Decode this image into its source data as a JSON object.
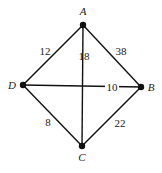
{
  "diagram": {
    "type": "weighted-graph",
    "vertices": [
      {
        "id": "A",
        "label": "A",
        "x": 83,
        "y": 25,
        "lx": 83,
        "ly": 15
      },
      {
        "id": "B",
        "label": "B",
        "x": 141,
        "y": 87,
        "lx": 151,
        "ly": 91
      },
      {
        "id": "C",
        "label": "C",
        "x": 82,
        "y": 146,
        "lx": 82,
        "ly": 161
      },
      {
        "id": "D",
        "label": "D",
        "x": 23,
        "y": 85,
        "lx": 12,
        "ly": 89
      }
    ],
    "edges": [
      {
        "from": "A",
        "to": "D",
        "weight": "12",
        "lx": 45,
        "ly": 55
      },
      {
        "from": "A",
        "to": "B",
        "weight": "38",
        "lx": 121,
        "ly": 55
      },
      {
        "from": "A",
        "to": "C",
        "weight": "18",
        "lx": 84,
        "ly": 60
      },
      {
        "from": "D",
        "to": "B",
        "weight": "10",
        "lx": 112,
        "ly": 91,
        "bg": true
      },
      {
        "from": "D",
        "to": "C",
        "weight": "8",
        "lx": 48,
        "ly": 126
      },
      {
        "from": "B",
        "to": "C",
        "weight": "22",
        "lx": 120,
        "ly": 127
      }
    ]
  }
}
